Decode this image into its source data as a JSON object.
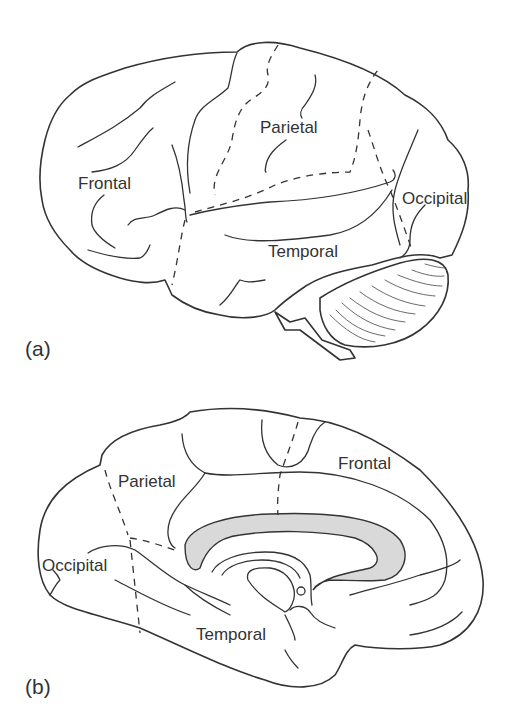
{
  "figure": {
    "panel_a": {
      "tag": "(a)",
      "view": "lateral",
      "labels": {
        "frontal": "Frontal",
        "parietal": "Parietal",
        "temporal": "Temporal",
        "occipital": "Occipital"
      }
    },
    "panel_b": {
      "tag": "(b)",
      "view": "medial",
      "labels": {
        "frontal": "Frontal",
        "parietal": "Parietal",
        "temporal": "Temporal",
        "occipital": "Occipital"
      },
      "highlight_color": "#d9d9d9"
    },
    "line_color": "#333333"
  }
}
